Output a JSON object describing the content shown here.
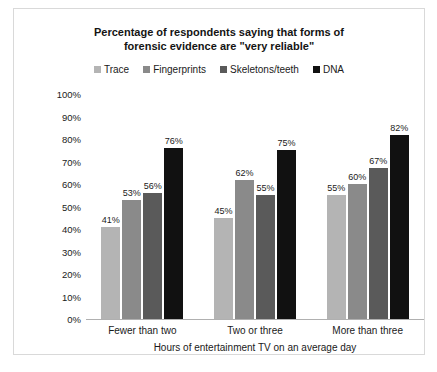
{
  "chart_data": {
    "type": "bar",
    "title": "Percentage of respondents saying that forms of forensic evidence are \"very reliable\"",
    "title_line1": "Percentage of respondents saying that forms of",
    "title_line2": "forensic evidence are \"very reliable\"",
    "xlabel": "Hours of entertainment TV on an average day",
    "ylabel": "",
    "ylim": [
      0,
      100
    ],
    "grid": false,
    "legend_position": "top",
    "categories": [
      "Fewer than two",
      "Two or three",
      "More than three"
    ],
    "ytick_labels": [
      "100%",
      "90%",
      "80%",
      "70%",
      "60%",
      "50%",
      "40%",
      "30%",
      "20%",
      "10%",
      "0%"
    ],
    "ytick_values": [
      100,
      90,
      80,
      70,
      60,
      50,
      40,
      30,
      20,
      10,
      0
    ],
    "series": [
      {
        "name": "Trace",
        "color": "#b4b4b4",
        "values": [
          41,
          45,
          55
        ],
        "labels": [
          "41%",
          "45%",
          "55%"
        ]
      },
      {
        "name": "Fingerprints",
        "color": "#8a8a8a",
        "values": [
          53,
          62,
          60
        ],
        "labels": [
          "53%",
          "62%",
          "60%"
        ]
      },
      {
        "name": "Skeletons/teeth",
        "color": "#5a5a5a",
        "values": [
          56,
          55,
          67
        ],
        "labels": [
          "56%",
          "55%",
          "67%"
        ]
      },
      {
        "name": "DNA",
        "color": "#111111",
        "values": [
          76,
          75,
          82
        ],
        "labels": [
          "76%",
          "75%",
          "82%"
        ]
      }
    ]
  }
}
